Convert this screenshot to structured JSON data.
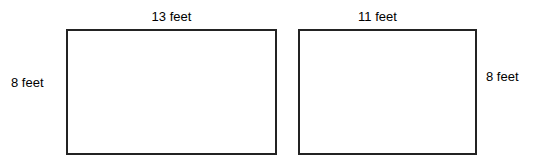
{
  "figure": {
    "background_color": "#ffffff",
    "stroke_color": "#232323",
    "text_color": "#000000",
    "shapes": [
      {
        "id": "left-rectangle",
        "shape": "rectangle",
        "width_label": "13 feet",
        "height_label": "8 feet",
        "width_value": 13,
        "height_value": 8,
        "unit": "feet",
        "width_label_position": "top",
        "height_label_position": "left"
      },
      {
        "id": "right-rectangle",
        "shape": "rectangle",
        "width_label": "11 feet",
        "height_label": "8 feet",
        "width_value": 11,
        "height_value": 8,
        "unit": "feet",
        "width_label_position": "top",
        "height_label_position": "right"
      }
    ]
  }
}
